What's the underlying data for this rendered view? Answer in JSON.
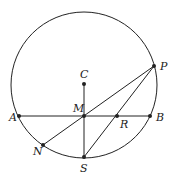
{
  "diagram": {
    "type": "geometry",
    "colors": {
      "stroke": "#222222",
      "background": "#ffffff"
    },
    "circle": {
      "center_label": "C",
      "cx": 84,
      "cy": 85,
      "r": 73
    },
    "points": [
      {
        "id": "A",
        "label": "A",
        "x": 19,
        "y": 116,
        "lx": 9,
        "ly": 121
      },
      {
        "id": "B",
        "label": "B",
        "x": 150,
        "y": 116,
        "lx": 156,
        "ly": 121
      },
      {
        "id": "C",
        "label": "C",
        "x": 84,
        "y": 84,
        "lx": 80,
        "ly": 78
      },
      {
        "id": "M",
        "label": "M",
        "x": 84,
        "y": 116,
        "lx": 73,
        "ly": 112
      },
      {
        "id": "R",
        "label": "R",
        "x": 117,
        "y": 116,
        "lx": 120,
        "ly": 128
      },
      {
        "id": "P",
        "label": "P",
        "x": 154,
        "y": 66,
        "lx": 160,
        "ly": 70
      },
      {
        "id": "N",
        "label": "N",
        "x": 43,
        "y": 145,
        "lx": 33,
        "ly": 155
      },
      {
        "id": "S",
        "label": "S",
        "x": 84,
        "y": 157,
        "lx": 80,
        "ly": 172
      }
    ],
    "segments": [
      {
        "from": "A",
        "to": "B"
      },
      {
        "from": "C",
        "to": "S"
      },
      {
        "from": "P",
        "to": "N"
      },
      {
        "from": "P",
        "to": "S"
      }
    ]
  }
}
